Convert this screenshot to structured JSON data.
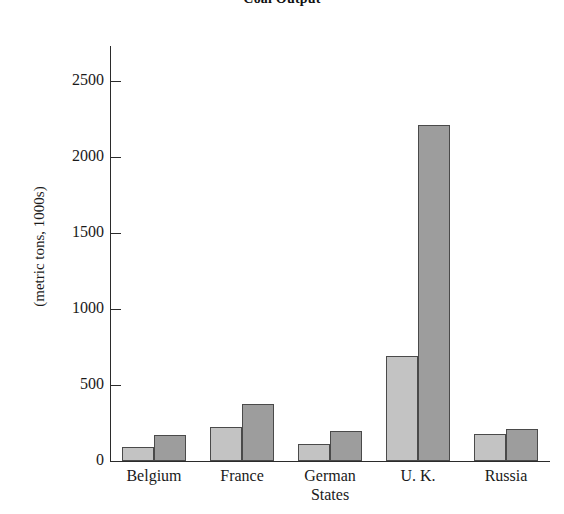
{
  "chart_data": {
    "type": "bar",
    "title": "Coal Output",
    "xlabel": "",
    "ylabel": "(metric tons, 1000s)",
    "categories": [
      "Belgium",
      "France",
      "German\nStates",
      "U. K.",
      "Russia"
    ],
    "series": [
      {
        "name": "light",
        "values": [
          90,
          225,
          110,
          690,
          180
        ]
      },
      {
        "name": "dark",
        "values": [
          170,
          375,
          195,
          2215,
          210
        ]
      }
    ],
    "ylim": [
      0,
      2700
    ],
    "yticks": [
      0,
      500,
      1000,
      1500,
      2000,
      2500
    ],
    "ytick_labels": [
      "0",
      "500",
      "1000",
      "1500",
      "2000",
      "2500"
    ],
    "grid": false,
    "legend": "none",
    "colors": {
      "light_bar": "#c3c3c3",
      "dark_bar": "#9d9d9d",
      "bar_edge": "#4a4a4a",
      "axis": "#2b2b2b",
      "text": "#1a1a1a",
      "background": "#ffffff"
    }
  }
}
